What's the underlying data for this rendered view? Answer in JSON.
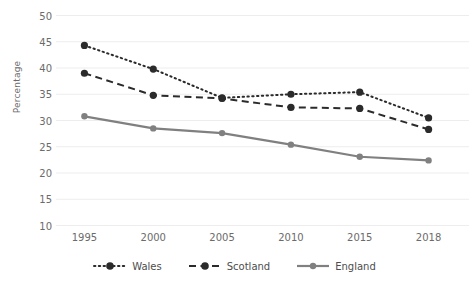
{
  "chart_data": {
    "type": "line",
    "title": "",
    "xlabel": "",
    "ylabel": "Percentage",
    "categories": [
      "1995",
      "2000",
      "2005",
      "2010",
      "2015",
      "2018"
    ],
    "ylim": [
      10,
      50
    ],
    "ytick_step": 5,
    "yticks": [
      "50",
      "45",
      "40",
      "35",
      "30",
      "25",
      "20",
      "15",
      "10"
    ],
    "grid": "horizontal",
    "legend_position": "bottom",
    "series": [
      {
        "name": "Wales",
        "values": [
          44.3,
          39.8,
          34.3,
          35.0,
          35.4,
          30.5
        ],
        "color": "#2b2b2b",
        "style": "dotted"
      },
      {
        "name": "Scotland",
        "values": [
          39.0,
          34.8,
          34.2,
          32.5,
          32.3,
          28.3
        ],
        "color": "#2b2b2b",
        "style": "dashed"
      },
      {
        "name": "England",
        "values": [
          30.8,
          28.5,
          27.6,
          25.4,
          23.1,
          22.4
        ],
        "color": "#808080",
        "style": "solid"
      }
    ]
  },
  "legend": {
    "items": [
      {
        "label": "Wales"
      },
      {
        "label": "Scotland"
      },
      {
        "label": "England"
      }
    ]
  },
  "colors": {
    "grid": "#ededed",
    "text": "#6b6b6b",
    "dark_series": "#2b2b2b",
    "gray_series": "#808080",
    "background": "#ffffff"
  }
}
